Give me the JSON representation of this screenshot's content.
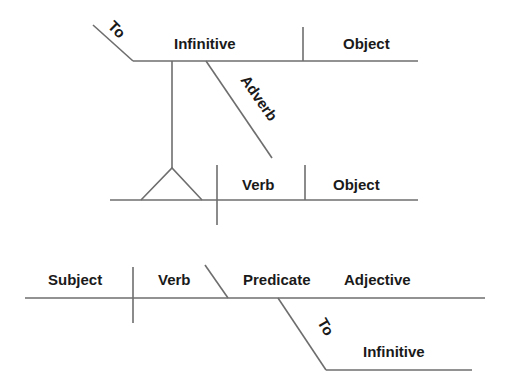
{
  "diagram": {
    "type": "sentence-diagram",
    "top_clause": {
      "to_label": "To",
      "infinitive_label": "Infinitive",
      "object_label": "Object",
      "adverb_label": "Adverb"
    },
    "middle_clause": {
      "verb_label": "Verb",
      "object_label": "Object"
    },
    "bottom_clause": {
      "subject_label": "Subject",
      "verb_label": "Verb",
      "predicate_label": "Predicate",
      "adjective_label": "Adjective",
      "to_label": "To",
      "infinitive_label": "Infinitive"
    },
    "colors": {
      "line": "#6e6e6e",
      "text": "#1a1a1a",
      "background": "#ffffff"
    }
  }
}
